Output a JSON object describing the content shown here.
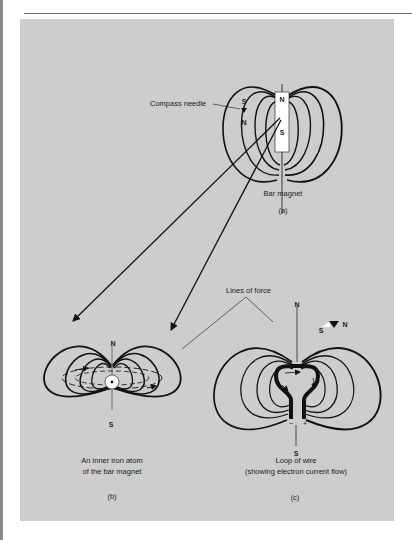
{
  "figure": {
    "panel_color": "#cdcdcd",
    "line_color": "#111111",
    "a": {
      "label_pole_n": "N",
      "label_pole_s": "S",
      "compass_label": "Compass needle",
      "compass_s": "S",
      "compass_n": "N",
      "magnet_label": "Bar magnet",
      "sublabel": "(a)"
    },
    "b": {
      "label_n": "N",
      "label_s": "S",
      "caption_line1": "An inner iron atom",
      "caption_line2": "of the bar magnet",
      "sublabel": "(b)"
    },
    "c": {
      "label_n": "N",
      "label_s": "S",
      "compass_s": "S",
      "compass_n": "N",
      "minus": "−",
      "plus": "+",
      "caption_line1": "Loop of wire",
      "caption_line2": "(showing electron current flow)",
      "sublabel": "(c)"
    },
    "lines_of_force_label": "Lines of force"
  }
}
